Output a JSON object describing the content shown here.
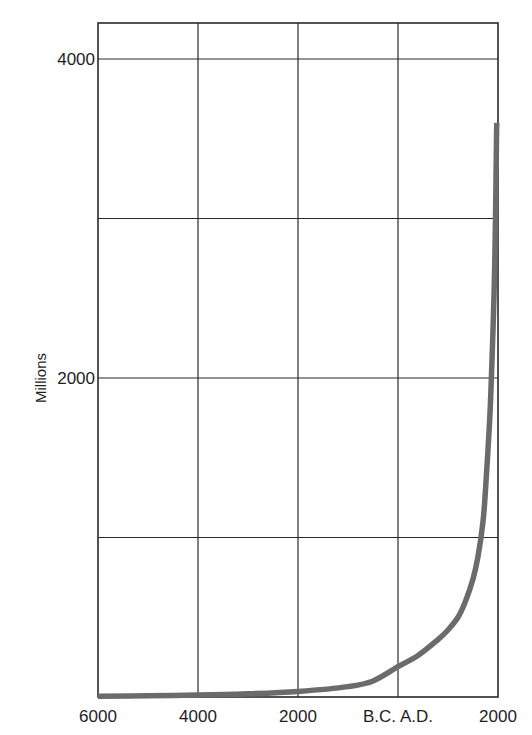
{
  "chart_data": {
    "type": "line",
    "title": "",
    "xlabel": "",
    "ylabel": "Millions",
    "x_tick_labels": [
      "6000",
      "4000",
      "2000",
      "B.C. A.D.",
      "2000"
    ],
    "x_ticks_year": [
      -6000,
      -4000,
      -2000,
      0,
      2000
    ],
    "y_tick_labels": [
      "2000",
      "4000"
    ],
    "y_ticks": [
      2000,
      4000
    ],
    "y_gridlines": [
      1000,
      2000,
      3000,
      4000
    ],
    "xlim": [
      -6000,
      2000
    ],
    "ylim": [
      0,
      4230
    ],
    "grid": true,
    "legend": null,
    "series": [
      {
        "name": "World population",
        "color": "#6b6b6b",
        "x": [
          -6000,
          -5000,
          -4000,
          -3000,
          -2000,
          -1000,
          -500,
          0,
          400,
          800,
          1000,
          1200,
          1350,
          1500,
          1600,
          1700,
          1750,
          1800,
          1850,
          1900,
          1930,
          1950,
          1960,
          1970,
          1975
        ],
        "values": [
          5,
          8,
          12,
          20,
          35,
          65,
          100,
          190,
          260,
          360,
          420,
          500,
          600,
          740,
          880,
          1100,
          1300,
          1550,
          1850,
          2300,
          2650,
          3000,
          3250,
          3500,
          3600
        ]
      }
    ]
  }
}
